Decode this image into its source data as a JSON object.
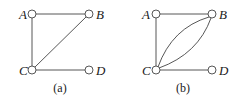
{
  "diagrams": [
    {
      "id": "a",
      "caption": "(a)",
      "caption_pos": [
        60,
        92
      ],
      "nodes": [
        {
          "label": "A",
          "x": 32,
          "y": 14,
          "label_x": 19,
          "label_y": 19
        },
        {
          "label": "B",
          "x": 89,
          "y": 14,
          "label_x": 96,
          "label_y": 19
        },
        {
          "label": "C",
          "x": 32,
          "y": 70,
          "label_x": 19,
          "label_y": 75
        },
        {
          "label": "D",
          "x": 89,
          "y": 70,
          "label_x": 96,
          "label_y": 75
        }
      ],
      "edges": [
        {
          "from": "A",
          "to": "B",
          "type": "straight"
        },
        {
          "from": "A",
          "to": "C",
          "type": "straight"
        },
        {
          "from": "C",
          "to": "B",
          "type": "straight"
        },
        {
          "from": "C",
          "to": "D",
          "type": "straight"
        }
      ]
    },
    {
      "id": "b",
      "caption": "(b)",
      "caption_pos": [
        183,
        92
      ],
      "nodes": [
        {
          "label": "A",
          "x": 156,
          "y": 14,
          "label_x": 142,
          "label_y": 19
        },
        {
          "label": "B",
          "x": 212,
          "y": 14,
          "label_x": 219,
          "label_y": 19
        },
        {
          "label": "C",
          "x": 156,
          "y": 70,
          "label_x": 142,
          "label_y": 75
        },
        {
          "label": "D",
          "x": 212,
          "y": 70,
          "label_x": 219,
          "label_y": 75
        }
      ],
      "edges": [
        {
          "from": "A",
          "to": "B",
          "type": "straight"
        },
        {
          "from": "A",
          "to": "C",
          "type": "straight"
        },
        {
          "from": "C",
          "to": "B",
          "type": "curve-upper"
        },
        {
          "from": "C",
          "to": "B",
          "type": "curve-lower"
        },
        {
          "from": "C",
          "to": "D",
          "type": "straight"
        }
      ]
    }
  ]
}
